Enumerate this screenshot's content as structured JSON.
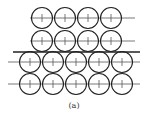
{
  "figure": {
    "caption": "(a)",
    "stroke_color": "#222222",
    "line_color": "#555555",
    "circle_radius": 10.5,
    "upper_block": {
      "rows": [
        {
          "y": 18,
          "centers_x": [
            42,
            65,
            88,
            111
          ],
          "axis_x": [
            30,
            135
          ]
        },
        {
          "y": 41,
          "centers_x": [
            42,
            65,
            88,
            111
          ],
          "axis_x": [
            30,
            135
          ]
        }
      ]
    },
    "interface_line": {
      "y": 52,
      "x": [
        13,
        140
      ]
    },
    "lower_block": {
      "rows": [
        {
          "y": 62,
          "centers_x": [
            30,
            53,
            76,
            99,
            122
          ],
          "axis_x": [
            8,
            140
          ]
        },
        {
          "y": 84,
          "centers_x": [
            30,
            53,
            76,
            99,
            122
          ],
          "axis_x": [
            8,
            140
          ]
        }
      ]
    }
  }
}
